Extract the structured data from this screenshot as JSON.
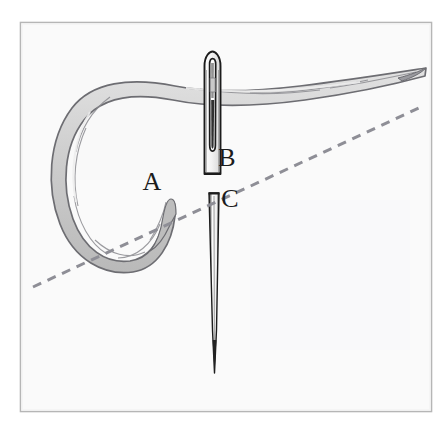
{
  "figure": {
    "kind": "line-drawing-illustration",
    "background_color": "#ffffff",
    "panel": {
      "name": "illustration-panel",
      "fill": "#fafafa",
      "border_color": "#b6b6b6",
      "x": 20,
      "y": 22,
      "width": 412,
      "height": 390
    },
    "labels": [
      {
        "id": "A",
        "text": "A",
        "x": 152,
        "y": 190,
        "description": "thread-hook-end-label"
      },
      {
        "id": "B",
        "text": "B",
        "x": 227,
        "y": 166,
        "description": "needle-eye-label"
      },
      {
        "id": "C",
        "text": "C",
        "x": 230,
        "y": 207,
        "description": "needle-shaft-label"
      }
    ],
    "dashed_line": {
      "name": "fabric-surface-line",
      "style": "dashed",
      "color": "#8e8e96",
      "dash_pattern": "9 7",
      "stroke_width": 3,
      "start": {
        "x": 33,
        "y": 287
      },
      "end": {
        "x": 421,
        "y": 107
      }
    },
    "needle": {
      "name": "sewing-needle",
      "outline_color": "#1c1c1c",
      "fill_color": "#f4f4f4",
      "upper_segment": {
        "description": "needle-head-with-eye",
        "top_y": 52,
        "bottom_y": 174,
        "center_x": 212,
        "width": 16
      },
      "eye": {
        "description": "needle-eye-slot",
        "top_y": 61,
        "bottom_y": 150
      },
      "lower_segment": {
        "description": "needle-shaft-tapering-to-point",
        "top_y": 192,
        "tip_y": 373,
        "center_x": 214
      }
    },
    "thread": {
      "name": "thread-strand",
      "fill_color": "#cfcfcf",
      "outline_color": "#6d6d72",
      "highlight_color": "#e8e8e8",
      "description": "thread-passes-through-needle-eye-loops-left-and-ends-in-hook-near-A",
      "right_tip": {
        "x": 426,
        "y": 68
      },
      "hook_tip": {
        "x": 172,
        "y": 200
      }
    }
  }
}
